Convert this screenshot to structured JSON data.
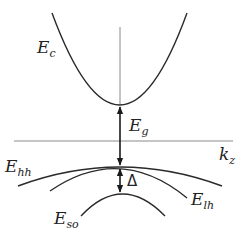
{
  "diagram": {
    "type": "band-structure",
    "axis": {
      "horizontal_label": {
        "main": "k",
        "sub": "z"
      }
    },
    "bands": {
      "conduction": {
        "main": "E",
        "sub": "c"
      },
      "heavy_hole": {
        "main": "E",
        "sub": "hh"
      },
      "light_hole": {
        "main": "E",
        "sub": "lh"
      },
      "split_off": {
        "main": "E",
        "sub": "so"
      }
    },
    "gaps": {
      "band_gap": {
        "main": "E",
        "sub": "g"
      },
      "spin_orbit_splitting": "Δ"
    },
    "colors": {
      "curve": "#2a2a2a",
      "axis": "#8a8a8a",
      "arrow": "#1a1a1a"
    }
  }
}
